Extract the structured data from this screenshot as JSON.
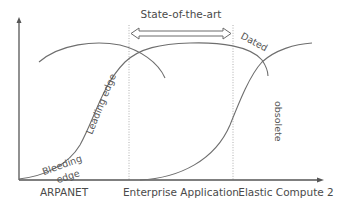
{
  "diagram": {
    "type": "technology-adoption-s-curves",
    "top_label": "State-of-the-art",
    "x_axis_labels": [
      {
        "text": "ARPANET",
        "x": 64
      },
      {
        "text": "Enterprise Application",
        "x": 181
      },
      {
        "text": "Elastic Compute 2",
        "x": 276
      }
    ],
    "curve_labels": {
      "bleeding": "Bleeding",
      "edge": "edge",
      "leading_edge": "Leading edge",
      "dated": "Dated",
      "obsolete": "obsolete"
    },
    "colors": {
      "axis": "#555555",
      "curve": "#6e6e6e",
      "text": "#4a4a4a",
      "background": "#ffffff"
    }
  }
}
